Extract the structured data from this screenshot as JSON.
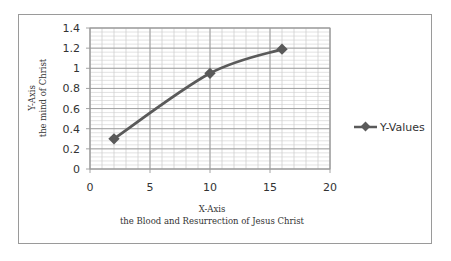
{
  "chart_data": {
    "type": "line",
    "title": "",
    "xlabel": "X-Axis\nthe Blood and Resurrection of  Jesus Christ",
    "xlabel_lines": [
      "X-Axis",
      "the Blood and Resurrection of  Jesus Christ"
    ],
    "ylabel": "Y-Axis\nthe mind of Christ",
    "ylabel_lines": [
      "Y-Axis",
      "the mind of Christ"
    ],
    "xlim": [
      0,
      20
    ],
    "ylim": [
      0,
      1.4
    ],
    "x_ticks": [
      "0",
      "5",
      "10",
      "15",
      "20"
    ],
    "y_ticks": [
      "0",
      "0.2",
      "0.4",
      "0.6",
      "0.8",
      "1",
      "1.2",
      "1.4"
    ],
    "grid": true,
    "legend_position": "right",
    "series": [
      {
        "name": "Y-Values",
        "x": [
          2,
          10,
          16
        ],
        "values": [
          0.3,
          0.95,
          1.19
        ],
        "marker": "diamond",
        "smooth": true,
        "color": "#5a5a5a"
      }
    ]
  },
  "colors": {
    "line": "#5a5a5a",
    "grid_major": "#9a9a9a",
    "grid_minor": "#cfcfcf",
    "border": "#9a9a9a",
    "text": "#333333"
  }
}
